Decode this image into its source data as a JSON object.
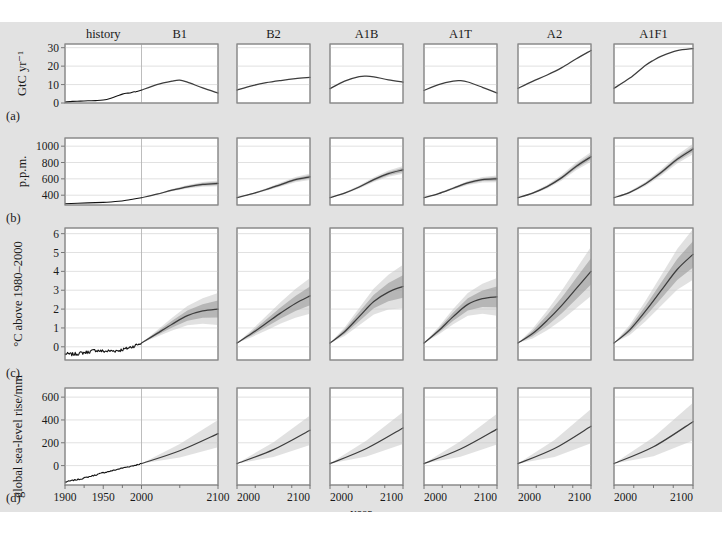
{
  "figure": {
    "background": "#e2e2e2",
    "panel_fill": "#ffffff",
    "line_color": "#3d3d3d",
    "band_outer_color": "#c9c9c9",
    "band_inner_color": "#9a9a9a",
    "xaxis_label": "year",
    "caption": ""
  },
  "columns": [
    {
      "key": "history",
      "label": "history",
      "wide": true
    },
    {
      "key": "B1",
      "label": "B1"
    },
    {
      "key": "B2",
      "label": "B2"
    },
    {
      "key": "A1B",
      "label": "A1B"
    },
    {
      "key": "A1T",
      "label": "A1T"
    },
    {
      "key": "A2",
      "label": "A2"
    },
    {
      "key": "A1F1",
      "label": "A1F1"
    }
  ],
  "rows": [
    {
      "key": "a",
      "tag": "(a)",
      "ylabel": "GtC yr⁻¹",
      "yticks": [
        0,
        10,
        20,
        30
      ],
      "ylim": [
        0,
        32
      ]
    },
    {
      "key": "b",
      "tag": "(b)",
      "ylabel": "p.p.m.",
      "yticks": [
        400,
        600,
        800,
        1000
      ],
      "ylim": [
        280,
        1100
      ]
    },
    {
      "key": "c",
      "tag": "(c)",
      "ylabel": "°C above 1980–2000",
      "yticks": [
        0,
        1,
        2,
        3,
        4,
        5,
        6
      ],
      "ylim": [
        -0.7,
        6.3
      ]
    },
    {
      "key": "d",
      "tag": "(d)",
      "ylabel": "global sea-level rise/mm",
      "yticks": [
        0,
        200,
        400,
        600
      ],
      "ylim": [
        -170,
        680
      ]
    }
  ],
  "xaxis": {
    "history_ticks": [
      1900,
      1950,
      2000
    ],
    "history_range": [
      1900,
      2000
    ],
    "future_ticks": [
      2000,
      2100
    ],
    "future_range": [
      2000,
      2100
    ],
    "label": "year"
  },
  "chart_data": {
    "type": "line",
    "title": "",
    "xlabel": "year",
    "legend": "none",
    "grid": true,
    "panels_layout": "4 rows (a-d) × 7 scenario columns; column 1 shows history 1900-2000 joined with B1 2000-2100",
    "rows": {
      "a": {
        "ylabel": "GtC yr-1",
        "ylim": [
          0,
          32
        ],
        "yticks": [
          0,
          10,
          20,
          30
        ],
        "history": {
          "x": [
            1900,
            1910,
            1920,
            1930,
            1940,
            1950,
            1960,
            1970,
            1975,
            1980,
            1985,
            1990,
            1992,
            1995,
            2000
          ],
          "y": [
            0.5,
            0.9,
            1.0,
            1.2,
            1.3,
            1.6,
            2.6,
            4.1,
            4.8,
            5.3,
            5.4,
            6.1,
            6.0,
            6.4,
            7.0
          ]
        },
        "scenarios": {
          "B1": {
            "x": [
              2000,
              2020,
              2040,
              2050,
              2060,
              2080,
              2100
            ],
            "y": [
              7.0,
              10.0,
              11.9,
              12.4,
              11.3,
              8.2,
              5.4
            ]
          },
          "B2": {
            "x": [
              2000,
              2020,
              2040,
              2060,
              2080,
              2100
            ],
            "y": [
              7.0,
              9.3,
              11.0,
              12.2,
              13.2,
              13.9
            ]
          },
          "A1B": {
            "x": [
              2000,
              2020,
              2040,
              2050,
              2060,
              2080,
              2100
            ],
            "y": [
              7.8,
              11.9,
              14.3,
              14.6,
              14.2,
              12.6,
              11.3
            ]
          },
          "A1T": {
            "x": [
              2000,
              2020,
              2040,
              2050,
              2060,
              2080,
              2100
            ],
            "y": [
              6.8,
              10.0,
              11.9,
              12.1,
              11.4,
              8.5,
              5.4
            ]
          },
          "A2": {
            "x": [
              2000,
              2020,
              2040,
              2060,
              2080,
              2100
            ],
            "y": [
              8.0,
              11.7,
              15.2,
              19.2,
              24.0,
              28.5
            ]
          },
          "A1F1": {
            "x": [
              2000,
              2020,
              2040,
              2050,
              2060,
              2080,
              2100
            ],
            "y": [
              8.0,
              13.5,
              20.5,
              23.2,
              25.4,
              28.4,
              29.5
            ]
          }
        }
      },
      "b": {
        "ylabel": "p.p.m.",
        "ylim": [
          280,
          1100
        ],
        "yticks": [
          400,
          600,
          800,
          1000
        ],
        "history": {
          "x": [
            1900,
            1930,
            1950,
            1960,
            1970,
            1980,
            1990,
            2000
          ],
          "y": [
            296,
            306,
            312,
            317,
            325,
            338,
            354,
            369
          ]
        },
        "scenarios": {
          "B1": {
            "x": [
              2000,
              2020,
              2040,
              2060,
              2080,
              2100
            ],
            "y": [
              369,
              412,
              461,
              503,
              532,
              545
            ],
            "band": [
              20,
              35
            ]
          },
          "B2": {
            "x": [
              2000,
              2020,
              2040,
              2060,
              2080,
              2100
            ],
            "y": [
              369,
              415,
              470,
              530,
              590,
              625
            ],
            "band": [
              22,
              40
            ]
          },
          "A1B": {
            "x": [
              2000,
              2020,
              2040,
              2060,
              2080,
              2100
            ],
            "y": [
              369,
              425,
              500,
              590,
              665,
              710
            ],
            "band": [
              25,
              48
            ]
          },
          "A1T": {
            "x": [
              2000,
              2020,
              2040,
              2060,
              2080,
              2100
            ],
            "y": [
              369,
              420,
              485,
              550,
              590,
              600
            ],
            "band": [
              22,
              42
            ]
          },
          "A2": {
            "x": [
              2000,
              2020,
              2040,
              2060,
              2080,
              2100
            ],
            "y": [
              369,
              425,
              505,
              615,
              755,
              870
            ],
            "band": [
              30,
              60
            ]
          },
          "A1F1": {
            "x": [
              2000,
              2020,
              2040,
              2060,
              2080,
              2100
            ],
            "y": [
              369,
              435,
              540,
              680,
              840,
              965
            ],
            "band": [
              32,
              65
            ]
          }
        }
      },
      "c": {
        "ylabel": "degC above 1980-2000",
        "ylim": [
          -0.7,
          6.3
        ],
        "yticks": [
          0,
          1,
          2,
          3,
          4,
          5,
          6
        ],
        "history_note": "noisy annual observed record 1900-2000 rising from about -0.4 to +0.2",
        "history": {
          "x": [
            1900,
            1910,
            1920,
            1930,
            1940,
            1950,
            1960,
            1970,
            1980,
            1990,
            2000
          ],
          "y": [
            -0.38,
            -0.4,
            -0.34,
            -0.28,
            -0.18,
            -0.24,
            -0.22,
            -0.2,
            -0.1,
            0.04,
            0.2
          ]
        },
        "scenarios": {
          "B1": {
            "x": [
              2000,
              2020,
              2040,
              2060,
              2080,
              2100
            ],
            "y": [
              0.2,
              0.7,
              1.2,
              1.65,
              1.9,
              2.0
            ],
            "band_inner": [
              0.25,
              0.45
            ],
            "band_outer": [
              0.45,
              0.85
            ]
          },
          "B2": {
            "x": [
              2000,
              2020,
              2040,
              2060,
              2080,
              2100
            ],
            "y": [
              0.2,
              0.7,
              1.25,
              1.8,
              2.3,
              2.7
            ],
            "band_inner": [
              0.25,
              0.5
            ],
            "band_outer": [
              0.45,
              0.95
            ]
          },
          "A1B": {
            "x": [
              2000,
              2020,
              2040,
              2060,
              2080,
              2100
            ],
            "y": [
              0.2,
              0.8,
              1.6,
              2.4,
              2.9,
              3.2
            ],
            "band_inner": [
              0.3,
              0.6
            ],
            "band_outer": [
              0.5,
              1.15
            ]
          },
          "A1T": {
            "x": [
              2000,
              2020,
              2040,
              2060,
              2080,
              2100
            ],
            "y": [
              0.2,
              0.85,
              1.6,
              2.25,
              2.55,
              2.65
            ],
            "band_inner": [
              0.3,
              0.55
            ],
            "band_outer": [
              0.5,
              1.0
            ]
          },
          "A2": {
            "x": [
              2000,
              2020,
              2040,
              2060,
              2080,
              2100
            ],
            "y": [
              0.2,
              0.7,
              1.4,
              2.2,
              3.1,
              4.0
            ],
            "band_inner": [
              0.3,
              0.7
            ],
            "band_outer": [
              0.5,
              1.3
            ]
          },
          "A1F1": {
            "x": [
              2000,
              2020,
              2040,
              2060,
              2080,
              2100
            ],
            "y": [
              0.2,
              0.9,
              1.9,
              3.0,
              4.1,
              4.9
            ],
            "band_inner": [
              0.3,
              0.7
            ],
            "band_outer": [
              0.55,
              1.35
            ]
          }
        }
      },
      "d": {
        "ylabel": "global sea-level rise/mm",
        "ylim": [
          -170,
          680
        ],
        "yticks": [
          0,
          200,
          400,
          600
        ],
        "history": {
          "x": [
            1900,
            1910,
            1920,
            1930,
            1940,
            1950,
            1960,
            1970,
            1980,
            1990,
            2000
          ],
          "y": [
            -145,
            -130,
            -118,
            -100,
            -82,
            -62,
            -48,
            -30,
            -14,
            0,
            18
          ]
        },
        "scenarios": {
          "B1": {
            "x": [
              2000,
              2050,
              2100
            ],
            "y": [
              18,
              130,
              280
            ],
            "band_outer": [
              12,
              120
            ]
          },
          "B2": {
            "x": [
              2000,
              2050,
              2100
            ],
            "y": [
              18,
              140,
              310
            ],
            "band_outer": [
              14,
              130
            ]
          },
          "A1B": {
            "x": [
              2000,
              2050,
              2100
            ],
            "y": [
              18,
              150,
              330
            ],
            "band_outer": [
              14,
              140
            ]
          },
          "A1T": {
            "x": [
              2000,
              2050,
              2100
            ],
            "y": [
              18,
              145,
              320
            ],
            "band_outer": [
              14,
              135
            ]
          },
          "A2": {
            "x": [
              2000,
              2050,
              2100
            ],
            "y": [
              18,
              150,
              345
            ],
            "band_outer": [
              15,
              150
            ]
          },
          "A1F1": {
            "x": [
              2000,
              2050,
              2100
            ],
            "y": [
              18,
              165,
              385
            ],
            "band_outer": [
              16,
              165
            ]
          }
        }
      }
    }
  }
}
